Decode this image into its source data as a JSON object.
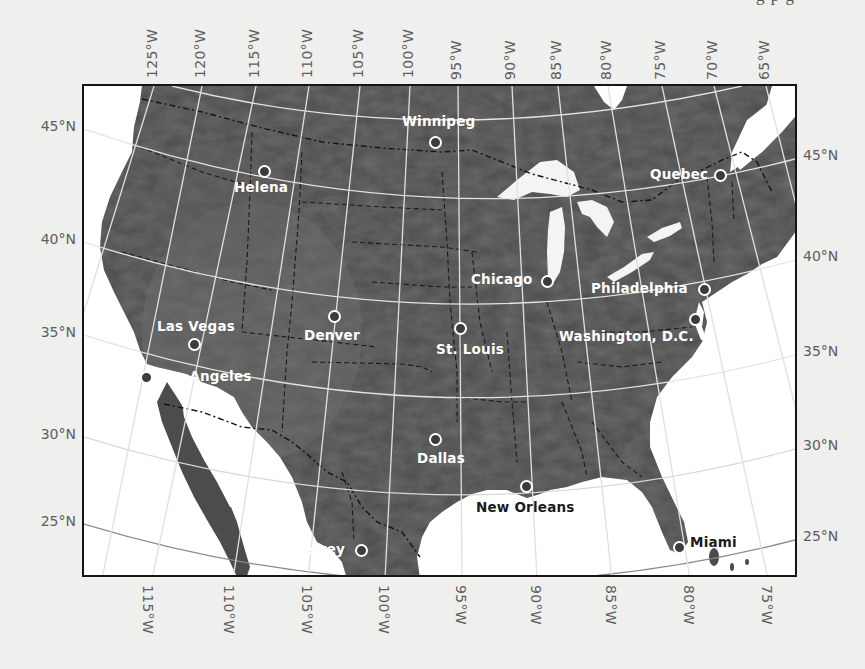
{
  "page": {
    "top_fragment": "g           p g"
  },
  "map": {
    "colors": {
      "land": "#4a4a4a",
      "land_light": "#6b6b6b",
      "water": "#ffffff",
      "graticule_land": "#e6e6e6",
      "graticule_water": "#6a6a6a",
      "border": "#141414",
      "frame": "#151515",
      "label_gray": "#5e5e5e",
      "background": "#efefed"
    },
    "longitude_labels_top": [
      {
        "label": "125°W",
        "x": 152
      },
      {
        "label": "120°W",
        "x": 200
      },
      {
        "label": "115°W",
        "x": 254
      },
      {
        "label": "110°W",
        "x": 307
      },
      {
        "label": "105°W",
        "x": 358
      },
      {
        "label": "100°W",
        "x": 408
      },
      {
        "label": "95°W",
        "x": 456
      },
      {
        "label": "90°W",
        "x": 510
      },
      {
        "label": "85°W",
        "x": 556
      },
      {
        "label": "80°W",
        "x": 606
      },
      {
        "label": "75°W",
        "x": 660
      },
      {
        "label": "70°W",
        "x": 712
      },
      {
        "label": "65°W",
        "x": 764
      }
    ],
    "longitude_labels_bottom": [
      {
        "label": "115°W",
        "x": 147
      },
      {
        "label": "110°W",
        "x": 228
      },
      {
        "label": "105°W",
        "x": 306
      },
      {
        "label": "100°W",
        "x": 383
      },
      {
        "label": "95°W",
        "x": 460
      },
      {
        "label": "90°W",
        "x": 535
      },
      {
        "label": "85°W",
        "x": 610
      },
      {
        "label": "80°W",
        "x": 688
      },
      {
        "label": "75°W",
        "x": 766
      }
    ],
    "latitude_labels_left": [
      {
        "label": "45°N",
        "y": 127
      },
      {
        "label": "40°N",
        "y": 240
      },
      {
        "label": "35°N",
        "y": 333
      },
      {
        "label": "30°N",
        "y": 435
      },
      {
        "label": "25°N",
        "y": 522
      }
    ],
    "latitude_labels_right": [
      {
        "label": "45°N",
        "y": 156
      },
      {
        "label": "40°N",
        "y": 257
      },
      {
        "label": "35°N",
        "y": 352
      },
      {
        "label": "30°N",
        "y": 446
      },
      {
        "label": "25°N",
        "y": 537
      }
    ],
    "cities": [
      {
        "name": "Winnipeg",
        "marker_x": 434,
        "marker_y": 140,
        "label_x": 400,
        "label_y": 112,
        "style": "light"
      },
      {
        "name": "Helena",
        "marker_x": 263,
        "marker_y": 169,
        "label_x": 232,
        "label_y": 178,
        "style": "light"
      },
      {
        "name": "Quebec",
        "marker_x": 719,
        "marker_y": 173,
        "label_x": 648,
        "label_y": 165,
        "style": "light"
      },
      {
        "name": "Chicago",
        "marker_x": 546,
        "marker_y": 279,
        "label_x": 469,
        "label_y": 270,
        "style": "light"
      },
      {
        "name": "Philadelphia",
        "marker_x": 703,
        "marker_y": 287,
        "label_x": 589,
        "label_y": 279,
        "style": "light"
      },
      {
        "name": "Washington, D.C.",
        "marker_x": 694,
        "marker_y": 317,
        "label_x": 557,
        "label_y": 327,
        "style": "light"
      },
      {
        "name": "Denver",
        "marker_x": 333,
        "marker_y": 314,
        "label_x": 302,
        "label_y": 326,
        "style": "light"
      },
      {
        "name": "St. Louis",
        "marker_x": 459,
        "marker_y": 326,
        "label_x": 434,
        "label_y": 340,
        "style": "light"
      },
      {
        "name": "Las Vegas",
        "marker_x": 193,
        "marker_y": 342,
        "label_x": 155,
        "label_y": 317,
        "style": "light"
      },
      {
        "name": "Los Angeles",
        "marker_x": 145,
        "marker_y": 375,
        "label_x": 156,
        "label_y": 367,
        "style": "light"
      },
      {
        "name": "Dallas",
        "marker_x": 434,
        "marker_y": 437,
        "label_x": 415,
        "label_y": 449,
        "style": "light"
      },
      {
        "name": "New Orleans",
        "marker_x": 525,
        "marker_y": 484,
        "label_x": 474,
        "label_y": 498,
        "style": "dark"
      },
      {
        "name": "Monterrey",
        "marker_x": 360,
        "marker_y": 548,
        "label_x": 262,
        "label_y": 540,
        "style": "light"
      },
      {
        "name": "Miami",
        "marker_x": 678,
        "marker_y": 545,
        "label_x": 688,
        "label_y": 533,
        "style": "dark"
      }
    ]
  }
}
